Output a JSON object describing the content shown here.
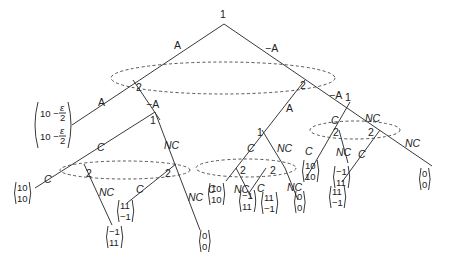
{
  "players": {
    "p1": "1",
    "p2": "2"
  },
  "actions": {
    "accept": "A",
    "not_accept": "−A",
    "cooperate": "C",
    "not_cooperate": "NC"
  },
  "nodes": {
    "root": "1",
    "left_p2": "2",
    "right_p2": "2",
    "left_p1": "1",
    "mid_p1": "1",
    "right_p1": "1",
    "ll_p2a": "2",
    "ll_p2b": "2",
    "m_p2a": "2",
    "m_p2b": "2",
    "r_p2a": "2",
    "r_p2b": "2"
  },
  "payoffs": {
    "eps_top": "10 − ε/2",
    "eps_bottom": "10 − ε/2",
    "eps_num": "ε",
    "eps_den": "2",
    "eps_prefix": "10 −",
    "left_cc": [
      "10",
      "10"
    ],
    "left_cnc": [
      "−1",
      "11"
    ],
    "left_ncc": [
      "11",
      "−1"
    ],
    "left_ncnc": [
      "0",
      "0"
    ],
    "mid_cc": [
      "10",
      "10"
    ],
    "mid_cnc": [
      "−1",
      "11"
    ],
    "mid_ncc": [
      "11",
      "−1"
    ],
    "mid_ncnc": [
      "0",
      "0"
    ],
    "right_cc": [
      "10",
      "10"
    ],
    "right_cnc": [
      "−1",
      "11"
    ],
    "right_ncc": [
      "11",
      "−1"
    ],
    "right_ncnc": [
      "0",
      "0"
    ]
  }
}
